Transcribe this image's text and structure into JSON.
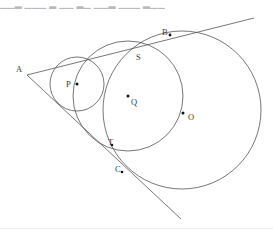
{
  "page": {
    "width": 273,
    "height": 232,
    "background": "#ffffff",
    "top_cropped_text": "▁▁▂ ▁▁▁ ▂ ▁▁  ▂▁  ▁▁▂  ▁▁▁  ▂▁▁"
  },
  "diagram": {
    "title": "",
    "stroke_color": "#545454",
    "label_color": "#3a3a3a",
    "dot_color": "#111111",
    "stroke_width": 0.8,
    "labels": [
      {
        "id": "A",
        "text": "A",
        "x": 16,
        "y": 65
      },
      {
        "id": "B",
        "text": "B",
        "x": 162,
        "y": 28
      },
      {
        "id": "S",
        "text": "S",
        "x": 136,
        "y": 53
      },
      {
        "id": "P",
        "text": "P",
        "x": 66,
        "y": 80
      },
      {
        "id": "Q",
        "text": "Q",
        "x": 131,
        "y": 98
      },
      {
        "id": "O",
        "text": "O",
        "x": 188,
        "y": 113
      },
      {
        "id": "T",
        "text": "T",
        "x": 108,
        "y": 138
      },
      {
        "id": "C",
        "text": "C",
        "x": 115,
        "y": 165
      }
    ],
    "points": [
      {
        "id": "P-center",
        "x": 77,
        "y": 84,
        "r": 1.5
      },
      {
        "id": "Q-center",
        "x": 128,
        "y": 96,
        "r": 1.5
      },
      {
        "id": "O-tangency",
        "x": 183,
        "y": 113,
        "r": 1.5
      },
      {
        "id": "B-tangency",
        "x": 170,
        "y": 35,
        "r": 1.4
      },
      {
        "id": "T-tangency",
        "x": 112,
        "y": 145,
        "r": 1.3
      },
      {
        "id": "C-tangency",
        "x": 122,
        "y": 172,
        "r": 1.3
      }
    ],
    "circles": [
      {
        "id": "circle-P",
        "cx": 77,
        "cy": 84,
        "r": 27
      },
      {
        "id": "circle-Q",
        "cx": 128,
        "cy": 96,
        "r": 55
      },
      {
        "id": "circle-O",
        "cx": 182,
        "cy": 110,
        "r": 79
      }
    ],
    "lines": [
      {
        "id": "upper-tangent",
        "x1": 27,
        "y1": 75,
        "x2": 254,
        "y2": 18
      },
      {
        "id": "lower-tangent",
        "x1": 27,
        "y1": 75,
        "x2": 181,
        "y2": 219
      }
    ]
  }
}
